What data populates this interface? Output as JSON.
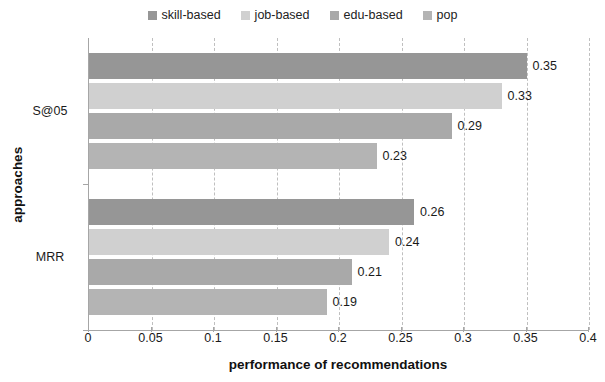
{
  "chart_data": {
    "type": "bar",
    "orientation": "horizontal",
    "title": "",
    "xlabel": "performance of recommendations",
    "ylabel": "approaches",
    "categories": [
      "S@05",
      "MRR"
    ],
    "xlim": [
      0,
      0.4
    ],
    "xticks": [
      "0",
      "0.05",
      "0.1",
      "0.15",
      "0.2",
      "0.25",
      "0.3",
      "0.35",
      "0.4"
    ],
    "xtick_values": [
      0,
      0.05,
      0.1,
      0.15,
      0.2,
      0.25,
      0.3,
      0.35,
      0.4
    ],
    "grid": "vertical-dashed",
    "legend_position": "top-center",
    "series": [
      {
        "name": "skill-based",
        "color": "#969696",
        "values": [
          0.35,
          0.26
        ],
        "labels": [
          "0.35",
          "0.26"
        ]
      },
      {
        "name": "job-based",
        "color": "#d0d0d0",
        "values": [
          0.33,
          0.24
        ],
        "labels": [
          "0.33",
          "0.24"
        ]
      },
      {
        "name": "edu-based",
        "color": "#a9a9a9",
        "values": [
          0.29,
          0.21
        ],
        "labels": [
          "0.29",
          "0.21"
        ]
      },
      {
        "name": "pop",
        "color": "#b4b4b4",
        "values": [
          0.23,
          0.19
        ],
        "labels": [
          "0.23",
          "0.19"
        ]
      }
    ]
  },
  "legend": {
    "items": [
      {
        "label": "skill-based",
        "color": "#969696"
      },
      {
        "label": "job-based",
        "color": "#d0d0d0"
      },
      {
        "label": "edu-based",
        "color": "#a9a9a9"
      },
      {
        "label": "pop",
        "color": "#b4b4b4"
      }
    ]
  },
  "axes": {
    "x_title": "performance of recommendations",
    "y_title": "approaches",
    "x_tick_labels": [
      "0",
      "0.05",
      "0.1",
      "0.15",
      "0.2",
      "0.25",
      "0.3",
      "0.35",
      "0.4"
    ],
    "y_category_labels": [
      "S@05",
      "MRR"
    ]
  },
  "bar_labels": {
    "s05": [
      "0.35",
      "0.33",
      "0.29",
      "0.23"
    ],
    "mrr": [
      "0.26",
      "0.24",
      "0.21",
      "0.19"
    ]
  }
}
